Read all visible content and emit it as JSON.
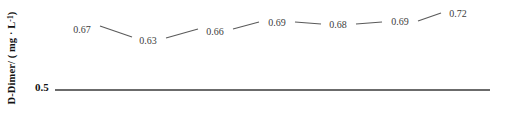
{
  "chart_data": {
    "type": "line",
    "title": "",
    "subtitle": "",
    "xlabel": "",
    "ylabel": "D-Dimer/ ( mg · L⁻¹ )",
    "ylabel_parts": {
      "prefix": "D-Dimer/ ( mg · L",
      "superscript": "-1",
      "suffix": " )"
    },
    "categories": [
      "1",
      "2",
      "3",
      "4",
      "5",
      "6",
      "7"
    ],
    "values": [
      0.67,
      0.63,
      0.66,
      0.69,
      0.68,
      0.69,
      0.72
    ],
    "point_labels": [
      "0.67",
      "0.63",
      "0.66",
      "0.69",
      "0.68",
      "0.69",
      "0.72"
    ],
    "ytick_labels": [
      "0.5"
    ],
    "yticks": [
      0.5
    ],
    "reference_line": {
      "value": 0.5,
      "label": "0.5"
    },
    "grid": false,
    "legend": null,
    "series": [
      {
        "name": "D-Dimer",
        "values": [
          0.67,
          0.63,
          0.66,
          0.69,
          0.68,
          0.69,
          0.72
        ]
      }
    ],
    "colors": {
      "line": "#5a5a5a",
      "baseline": "#3a3a3a",
      "label_text": "#3d3d3d",
      "axis_text": "#111111",
      "background": "#ffffff"
    },
    "geometry": {
      "baseline_y": 90,
      "baseline_x0": 55,
      "baseline_x1": 490,
      "label_points": [
        {
          "x": 82,
          "y": 29
        },
        {
          "x": 148,
          "y": 40
        },
        {
          "x": 215,
          "y": 31
        },
        {
          "x": 277,
          "y": 22
        },
        {
          "x": 338,
          "y": 24
        },
        {
          "x": 400,
          "y": 21
        },
        {
          "x": 458,
          "y": 13
        }
      ],
      "segments": [
        {
          "x1": 100,
          "y1": 26,
          "x2": 132,
          "y2": 37
        },
        {
          "x1": 166,
          "y1": 38,
          "x2": 198,
          "y2": 29
        },
        {
          "x1": 233,
          "y1": 29,
          "x2": 259,
          "y2": 22
        },
        {
          "x1": 295,
          "y1": 22,
          "x2": 321,
          "y2": 24
        },
        {
          "x1": 356,
          "y1": 24,
          "x2": 382,
          "y2": 22
        },
        {
          "x1": 418,
          "y1": 21,
          "x2": 441,
          "y2": 13
        }
      ]
    }
  }
}
